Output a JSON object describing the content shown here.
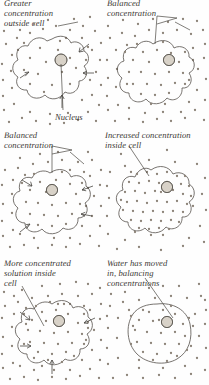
{
  "figure": {
    "title_visible": false,
    "panel_count": 6,
    "colors": {
      "background": "#fefefe",
      "ink": "#4a4742",
      "dot": "#8c8378",
      "caption_text": "#3a3733",
      "nucleus_fill": "#cfc8bd",
      "cell_outline": "#55514b"
    }
  },
  "panels": [
    {
      "id": "panel-1",
      "caption": "Greater\nconcentration\noutside cell",
      "sub_label": "Nucleus",
      "state": "hypertonic-outside",
      "dots_inside": 14,
      "dots_outside": 48,
      "arrows": 3,
      "arrow_direction": "inward",
      "cell_shape": "lobed"
    },
    {
      "id": "panel-2",
      "caption": "Balanced\nconcentration",
      "state": "isotonic",
      "dots_inside": 26,
      "dots_outside": 46,
      "arrows": 0,
      "arrow_direction": "none",
      "cell_shape": "lobed"
    },
    {
      "id": "panel-3",
      "caption": "Balanced\nconcentration",
      "state": "isotonic",
      "dots_inside": 22,
      "dots_outside": 44,
      "arrows": 4,
      "arrow_direction": "inward",
      "cell_shape": "lobed"
    },
    {
      "id": "panel-4",
      "caption": "Increased concentration\ninside cell",
      "state": "hypertonic-inside",
      "dots_inside": 52,
      "dots_outside": 22,
      "arrows": 0,
      "arrow_direction": "none",
      "cell_shape": "lobed"
    },
    {
      "id": "panel-5",
      "caption": "More concentrated\nsolution inside\ncell",
      "state": "hypertonic-inside-water-entering",
      "dots_inside": 34,
      "dots_outside": 48,
      "arrows": 4,
      "arrow_direction": "inward",
      "cell_shape": "lobed"
    },
    {
      "id": "panel-6",
      "caption": "Water has moved\nin, balancing\nconcentrations",
      "state": "equilibrium-swollen",
      "dots_inside": 30,
      "dots_outside": 40,
      "arrows": 0,
      "arrow_direction": "none",
      "cell_shape": "round-swollen"
    }
  ]
}
